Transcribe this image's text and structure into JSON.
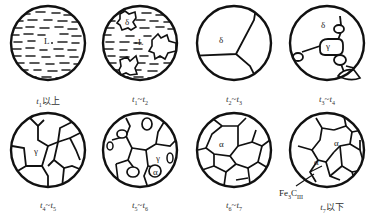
{
  "figure": {
    "panels": [
      {
        "id": "p1",
        "caption_var": "t",
        "caption_sub": "1",
        "caption_suffix": "以上",
        "caption_text": "t1以上",
        "phases": [
          "L",
          "·"
        ]
      },
      {
        "id": "p2",
        "caption_text": "t1~t2",
        "from": "1",
        "to": "2",
        "phases": [
          "δ",
          "L"
        ]
      },
      {
        "id": "p3",
        "caption_text": "t2~t3",
        "from": "2",
        "to": "3",
        "phases": [
          "δ"
        ]
      },
      {
        "id": "p4",
        "caption_text": "t3~t4",
        "from": "3",
        "to": "4",
        "phases": [
          "δ",
          "γ"
        ]
      },
      {
        "id": "p5",
        "caption_text": "t4~t5",
        "from": "4",
        "to": "5",
        "phases": [
          "γ"
        ]
      },
      {
        "id": "p6",
        "caption_text": "t5~t6",
        "from": "5",
        "to": "6",
        "phases": [
          "γ",
          "α"
        ]
      },
      {
        "id": "p7",
        "caption_text": "t6~t7",
        "from": "6",
        "to": "7",
        "phases": [
          "α"
        ]
      },
      {
        "id": "p8",
        "caption_var": "t",
        "caption_sub": "7",
        "caption_suffix": "以下",
        "caption_text": "t7以下",
        "phases": [
          "α",
          "α"
        ],
        "annotation": {
          "text": "Fe",
          "sub1": "3",
          "mid": "C",
          "sub2": "III",
          "full": "Fe3CIII"
        }
      }
    ],
    "tilde": "~",
    "var": "t"
  }
}
